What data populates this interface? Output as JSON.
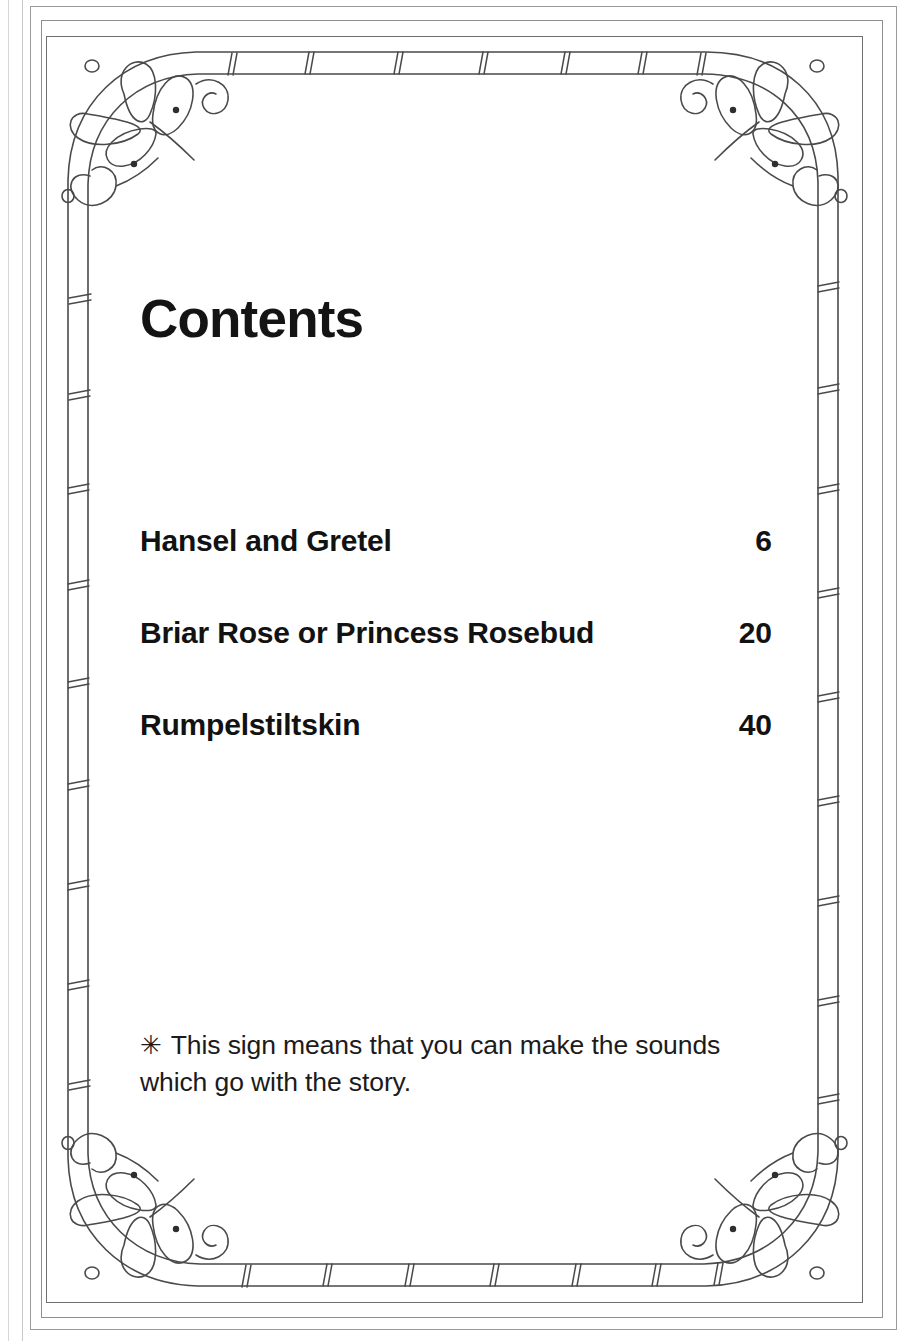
{
  "page": {
    "title": "Contents",
    "background_color": "#ffffff",
    "ink_color": "#121212"
  },
  "contents": {
    "heading": "Contents",
    "entries": [
      {
        "title": "Hansel and Gretel",
        "page": "6"
      },
      {
        "title": "Briar Rose or Princess Rosebud",
        "page": "20"
      },
      {
        "title": "Rumpelstiltskin",
        "page": "40"
      }
    ]
  },
  "footnote": {
    "symbol": "✳",
    "text": "This sign means that you can make the sounds which go with the story."
  },
  "ornament": {
    "style": "bamboo-frame-with-butterflies",
    "line_color": "#4a4a4a",
    "corners": [
      "butterfly-top-left",
      "butterfly-top-right",
      "butterfly-bottom-left",
      "butterfly-bottom-right"
    ]
  }
}
